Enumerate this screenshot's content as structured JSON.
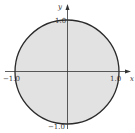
{
  "diagram": {
    "type": "region-plot",
    "shape": {
      "kind": "disk",
      "center": [
        0,
        0
      ],
      "radius": 1.0
    },
    "colors": {
      "fill": "#e2e2e2",
      "outline": "#2a2a2a",
      "axes": "#333333",
      "background": "#ffffff"
    },
    "axes": {
      "x_label": "x",
      "y_label": "y",
      "ticks": {
        "x_neg": "−1.0",
        "x_pos": "1.0",
        "y_pos": "1.0",
        "y_neg": "−1.0"
      }
    }
  }
}
